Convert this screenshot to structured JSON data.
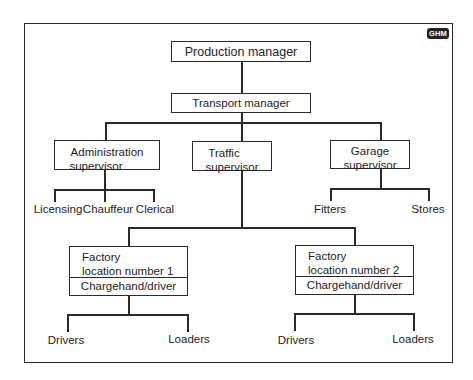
{
  "badge": {
    "label": "GHM"
  },
  "chart": {
    "nodes": {
      "production_manager": "Production manager",
      "transport_manager": "Transport manager",
      "admin_supervisor": {
        "line1": "Administration",
        "line2": "supervisor"
      },
      "traffic_supervisor": {
        "line1": "Traffic",
        "line2": "supervisor"
      },
      "garage_supervisor": {
        "line1": "Garage",
        "line2": "supervisor"
      },
      "factory1": {
        "line1": "Factory",
        "line2": "location number 1",
        "role": "Chargehand/driver"
      },
      "factory2": {
        "line1": "Factory",
        "line2": "location number 2",
        "role": "Chargehand/driver"
      }
    },
    "leaves": {
      "admin": [
        "Licensing",
        "Chauffeur",
        "Clerical"
      ],
      "garage": [
        "Fitters",
        "Stores"
      ],
      "factory1": [
        "Drivers",
        "Loaders"
      ],
      "factory2": [
        "Drivers",
        "Loaders"
      ]
    },
    "hierarchy": [
      {
        "parent": "Production manager",
        "children": [
          "Transport manager"
        ]
      },
      {
        "parent": "Transport manager",
        "children": [
          "Administration supervisor",
          "Traffic supervisor",
          "Garage supervisor"
        ]
      },
      {
        "parent": "Administration supervisor",
        "children": [
          "Licensing",
          "Chauffeur",
          "Clerical"
        ]
      },
      {
        "parent": "Traffic supervisor",
        "children": [
          "Factory location number 1",
          "Factory location number 2"
        ]
      },
      {
        "parent": "Garage supervisor",
        "children": [
          "Fitters",
          "Stores"
        ]
      },
      {
        "parent": "Factory location number 1 (Chargehand/driver)",
        "children": [
          "Drivers",
          "Loaders"
        ]
      },
      {
        "parent": "Factory location number 2 (Chargehand/driver)",
        "children": [
          "Drivers",
          "Loaders"
        ]
      }
    ]
  }
}
